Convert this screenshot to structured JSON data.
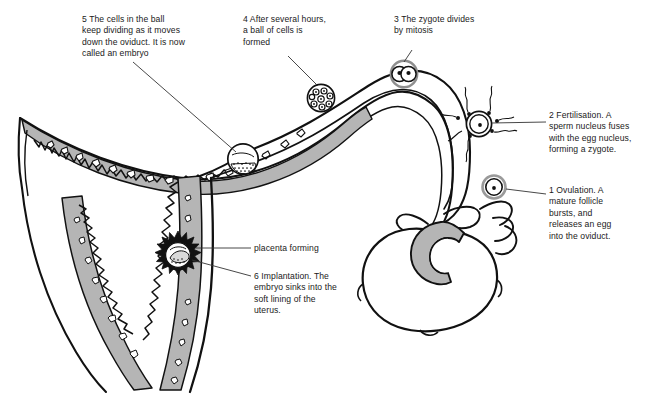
{
  "figure": {
    "type": "labelled-biological-diagram",
    "background_color": "#ffffff",
    "line_color": "#111111",
    "tissue_fill": "#b5b5b5",
    "text_color": "#1a1a1a"
  },
  "callouts": {
    "ovulation": {
      "number": "1",
      "text": "Ovulation. A mature follicle bursts, and releases an egg into the oviduct.",
      "full": "1   Ovulation. A\nmature follicle\nbursts, and\nreleases an egg\ninto the oviduct."
    },
    "fertilisation": {
      "number": "2",
      "text": "Fertilisation. A sperm nucleus fuses with the egg nucleus, forming a zygote.",
      "full": "2   Fertilisation. A\nsperm nucleus fuses\nwith the egg nucleus,\nforming a zygote."
    },
    "zygote_divides": {
      "number": "3",
      "text": "The zygote divides by mitosis",
      "full": "3   The zygote divides\nby mitosis"
    },
    "ball_of_cells": {
      "number": "4",
      "text": "After several hours, a ball of cells is formed",
      "full": "4   After several hours,\na ball of cells is\nformed"
    },
    "embryo": {
      "number": "5",
      "text": "The cells in the ball keep dividing as it moves down the oviduct. It is now called an embryo",
      "full": "5   The cells in the ball\nkeep dividing as it moves\ndown the oviduct. It is now\ncalled an embryo"
    },
    "implantation": {
      "number": "6",
      "text": "Implantation. The embryo sinks into the soft lining of the uterus.",
      "full": "6   Implantation. The\nembryo sinks into the\nsoft lining of the\nuterus."
    },
    "placenta": {
      "number": "",
      "text": "placenta forming",
      "full": "placenta forming"
    }
  },
  "structures": [
    {
      "name": "ovary",
      "label": ""
    },
    {
      "name": "ruptured-follicle",
      "label": ""
    },
    {
      "name": "fimbriae",
      "label": ""
    },
    {
      "name": "oviduct",
      "label": ""
    },
    {
      "name": "uterus-wall",
      "label": ""
    },
    {
      "name": "endometrium-lining",
      "label": ""
    },
    {
      "name": "egg-cell",
      "label": ""
    },
    {
      "name": "sperm-cells",
      "label": ""
    },
    {
      "name": "two-cell-zygote",
      "label": ""
    },
    {
      "name": "morula",
      "label": ""
    },
    {
      "name": "blastocyst",
      "label": ""
    },
    {
      "name": "implanted-embryo",
      "label": ""
    }
  ]
}
